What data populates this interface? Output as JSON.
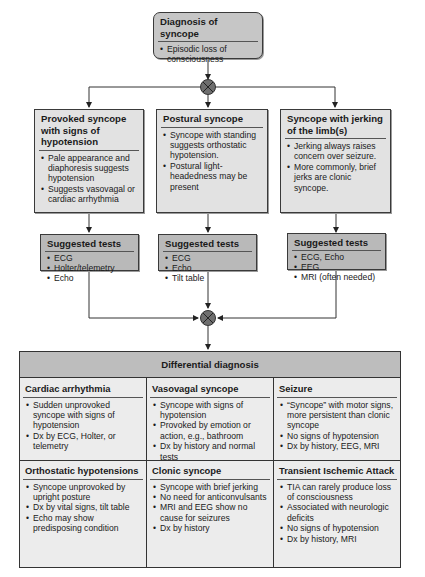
{
  "diagram": {
    "top": {
      "title": "Diagnosis of syncope",
      "bullets": [
        "Episodic loss of consciousness"
      ]
    },
    "branches": [
      {
        "title": "Provoked syncope with signs of hypotension",
        "bullets": [
          "Pale appearance and diaphoresis suggests hypotension",
          "Suggests vasovagal or cardiac arrhythmia"
        ],
        "tests_title": "Suggested tests",
        "tests": [
          "ECG",
          "Holter/telemetry",
          "Echo"
        ]
      },
      {
        "title": "Postural syncope",
        "bullets": [
          "Syncope with standing suggests orthostatic hypotension.",
          "Postural light-headedness may be present"
        ],
        "tests_title": "Suggested tests",
        "tests": [
          "ECG",
          "Echo",
          "Tilt table"
        ]
      },
      {
        "title": "Syncope with jerking of the limb(s)",
        "bullets": [
          "Jerking always raises concern over seizure.",
          "More commonly, brief jerks are clonic syncope."
        ],
        "tests_title": "Suggested tests",
        "tests": [
          "ECG, Echo",
          "EEG",
          "MRI (often needed)"
        ]
      }
    ],
    "differential": {
      "header": "Differential diagnosis",
      "cells": [
        {
          "title": "Cardiac arrhythmia",
          "bullets": [
            "Sudden unprovoked syncope with signs of hypotension",
            "Dx by ECG, Holter, or telemetry"
          ]
        },
        {
          "title": "Vasovagal syncope",
          "bullets": [
            "Syncope with signs of hypotension",
            "Provoked by emotion or action, e.g., bathroom",
            "Dx by history and normal tests"
          ]
        },
        {
          "title": "Seizure",
          "bullets": [
            "“Syncope” with motor signs, more persistent than clonic syncope",
            "No signs of hypotension",
            "Dx by history, EEG, MRI"
          ]
        },
        {
          "title": "Orthostatic hypotensions",
          "bullets": [
            "Syncope unprovoked by upright posture",
            "Dx by vital signs, tilt table",
            "Echo may show predisposing condition"
          ]
        },
        {
          "title": "Clonic syncope",
          "bullets": [
            "Syncope with brief jerking",
            "No need for anticonvulsants",
            "MRI and EEG show no cause for seizures",
            "Dx by history"
          ]
        },
        {
          "title": "Transient Ischemic Attack",
          "bullets": [
            "TIA can rarely produce loss of consciousness",
            "Associated with neurologic deficits",
            "No signs of hypotension",
            "Dx by history, MRI"
          ]
        }
      ]
    },
    "colors": {
      "box_fill": "#e2e2e2",
      "tests_fill": "#b9b9b9",
      "top_fill": "#c6c6c6",
      "header_fill": "#bdbdbd",
      "line": "#3a3a3a",
      "junction": "#6e6e6e"
    }
  }
}
